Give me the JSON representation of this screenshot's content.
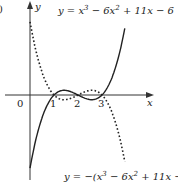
{
  "chart_data": {
    "type": "line",
    "title": "",
    "xlabel": "x",
    "ylabel": "y",
    "origin_label": "0",
    "panel_label_fragment": ")",
    "x_ticks": [
      {
        "value": 1,
        "label": "1"
      },
      {
        "value": 2,
        "label": "2"
      },
      {
        "value": 3,
        "label": "3"
      }
    ],
    "series": [
      {
        "name": "y = x³ − 6x² + 11x − 6",
        "style": "solid",
        "x": [
          0,
          0.5,
          1,
          1.5,
          2,
          2.5,
          3,
          3.5,
          3.95
        ],
        "values": [
          -6,
          -1.875,
          0,
          0.375,
          0,
          -0.375,
          0,
          1.875,
          5.2
        ]
      },
      {
        "name": "y = −(x³ − 6x² + 11x − 6)",
        "style": "dotted",
        "x": [
          0,
          0.5,
          1,
          1.5,
          2,
          2.5,
          3,
          3.5,
          3.95
        ],
        "values": [
          6,
          1.875,
          0,
          -0.375,
          0,
          0.375,
          0,
          -1.875,
          -5.2
        ]
      }
    ],
    "roots": [
      1,
      2,
      3
    ],
    "annotations": [
      {
        "text_prefix": "y = x",
        "sup1": "3",
        "mid": " − 6x",
        "sup2": "2",
        "suffix": " + 11x − 6"
      },
      {
        "text_prefix": "y = −(x",
        "sup1": "3",
        "mid": " − 6x",
        "sup2": "2",
        "suffix": " + 11x − 6)"
      }
    ],
    "xlim": [
      -1.2,
      5
    ],
    "ylim": [
      -6.8,
      7.6
    ],
    "grid": false,
    "legend": "none"
  }
}
